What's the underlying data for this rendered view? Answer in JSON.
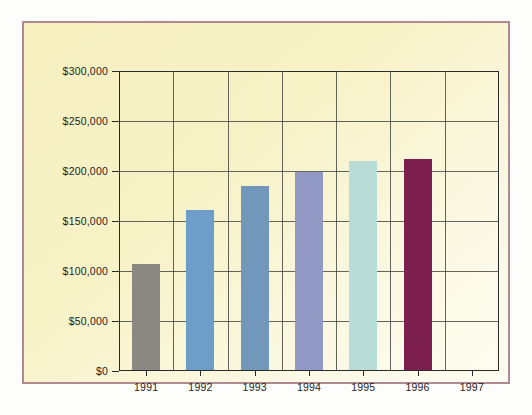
{
  "chart_data": {
    "type": "bar",
    "title": "",
    "xlabel": "",
    "ylabel": "",
    "categories": [
      "1991",
      "1992",
      "1993",
      "1994",
      "1995",
      "1996",
      "1997"
    ],
    "values": [
      106000,
      160000,
      184000,
      198000,
      209000,
      211000,
      null
    ],
    "ylim": [
      0,
      300000
    ],
    "ytick_values": [
      0,
      50000,
      100000,
      150000,
      200000,
      250000,
      300000
    ],
    "ytick_labels": [
      "$0",
      "$50,000",
      "$100,000",
      "$150,000",
      "$200,000",
      "$250,000",
      "$300,000"
    ],
    "grid": true,
    "legend": "none",
    "bar_colors": [
      "#8a8880",
      "#6d9ec9",
      "#7198bb",
      "#9199c4",
      "#b8dcd8",
      "#7d1f4e",
      "transparent"
    ],
    "series": [
      {
        "name": "Annual amount",
        "points": [
          {
            "category": "1991",
            "value": 106000,
            "label": "$106,000",
            "color": "#8a8880"
          },
          {
            "category": "1992",
            "value": 160000,
            "label": "$160,000",
            "color": "#6d9ec9"
          },
          {
            "category": "1993",
            "value": 184000,
            "label": "$184,000",
            "color": "#7198bb"
          },
          {
            "category": "1994",
            "value": 198000,
            "label": "$198,000",
            "color": "#9199c4"
          },
          {
            "category": "1995",
            "value": 209000,
            "label": "$209,000",
            "color": "#b8dcd8"
          },
          {
            "category": "1996",
            "value": 211000,
            "label": "$211,000",
            "color": "#7d1f4e"
          },
          {
            "category": "1997",
            "value": null,
            "label": "",
            "color": "transparent"
          }
        ]
      }
    ]
  },
  "style": {
    "plate_border_color": "#b08a90",
    "background_top": "#f6f0c0",
    "background_bottom": "#fdfcf0",
    "grid_color": "#4a4a42",
    "axis_color": "#2a2a2a",
    "page_background": "#fdfdfb"
  }
}
